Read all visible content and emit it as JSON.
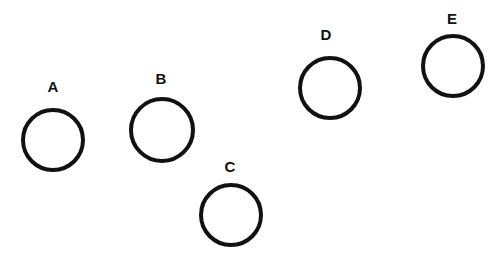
{
  "nodes": [
    {
      "label": "A",
      "cx": 53,
      "cy": 140,
      "r": 32,
      "lx": 53,
      "ly": 78
    },
    {
      "label": "B",
      "cx": 162,
      "cy": 130,
      "r": 33,
      "lx": 161,
      "ly": 70
    },
    {
      "label": "C",
      "cx": 231,
      "cy": 215,
      "r": 32,
      "lx": 230,
      "ly": 158
    },
    {
      "label": "D",
      "cx": 330,
      "cy": 88,
      "r": 32,
      "lx": 326,
      "ly": 26
    },
    {
      "label": "E",
      "cx": 453,
      "cy": 66,
      "r": 32,
      "lx": 452,
      "ly": 10
    }
  ],
  "colors": {
    "stroke": "#111111",
    "background": "#ffffff"
  }
}
